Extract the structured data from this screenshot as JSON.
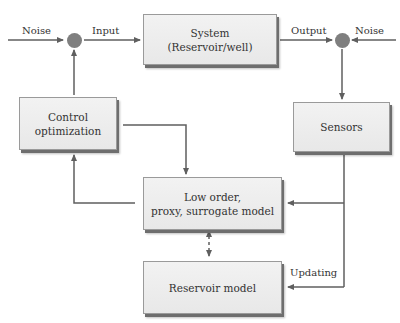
{
  "diagram": {
    "colors": {
      "line": "#5f5f5f",
      "box_fill": "#ededed",
      "node": "#7f7f7f",
      "text": "#333333"
    },
    "boxes": {
      "system": {
        "line1": "System",
        "line2": "(Reservoir/well)"
      },
      "control": {
        "line1": "Control",
        "line2": "optimization"
      },
      "sensors": {
        "line1": "Sensors"
      },
      "surrogate": {
        "line1": "Low order,",
        "line2": "proxy, surrogate model"
      },
      "reservoir": {
        "line1": "Reservoir model"
      }
    },
    "labels": {
      "noise_left": "Noise",
      "input": "Input",
      "output": "Output",
      "noise_right": "Noise",
      "updating": "Updating"
    },
    "nodes": [
      {
        "name": "summing-junction-input"
      },
      {
        "name": "summing-junction-output"
      }
    ],
    "edges": [
      {
        "from": "noise_left",
        "to": "summing-junction-input"
      },
      {
        "from": "summing-junction-input",
        "to": "system",
        "label": "Input"
      },
      {
        "from": "system",
        "to": "summing-junction-output",
        "label": "Output"
      },
      {
        "from": "noise_right",
        "to": "summing-junction-output"
      },
      {
        "from": "summing-junction-output",
        "to": "sensors"
      },
      {
        "from": "sensors",
        "to": "surrogate"
      },
      {
        "from": "sensors",
        "to": "reservoir",
        "label": "Updating"
      },
      {
        "from": "control",
        "to": "surrogate"
      },
      {
        "from": "surrogate",
        "to": "control"
      },
      {
        "from": "control",
        "to": "summing-junction-input"
      },
      {
        "from": "surrogate",
        "to": "reservoir",
        "style": "dashed-bidirectional"
      }
    ]
  }
}
